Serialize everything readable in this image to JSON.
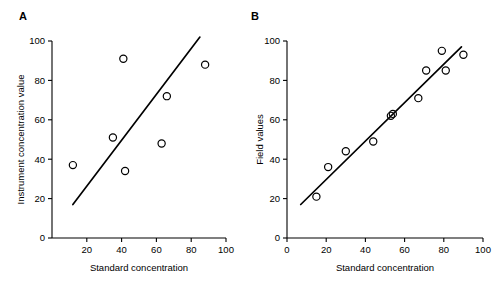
{
  "figure": {
    "background": "#ffffff",
    "ink": "#000000"
  },
  "chart_data": [
    {
      "type": "scatter",
      "panel_label": "A",
      "title": "",
      "xlabel": "Standard concentration",
      "ylabel": "Instrument concentration value",
      "xlim": [
        0,
        100
      ],
      "ylim": [
        0,
        100
      ],
      "xticks": [
        20,
        40,
        60,
        80,
        100
      ],
      "xtick_labels": [
        "20",
        "40",
        "60",
        "80",
        "100"
      ],
      "yticks": [
        0,
        20,
        40,
        60,
        80,
        100
      ],
      "ytick_labels": [
        "0",
        "20",
        "40",
        "60",
        "80",
        "100"
      ],
      "grid": false,
      "legend": "none",
      "marker": "open-circle",
      "points": [
        {
          "x": 12,
          "y": 37
        },
        {
          "x": 35,
          "y": 51
        },
        {
          "x": 41,
          "y": 91
        },
        {
          "x": 42,
          "y": 34
        },
        {
          "x": 63,
          "y": 48
        },
        {
          "x": 66,
          "y": 72
        },
        {
          "x": 88,
          "y": 88
        }
      ],
      "fit_line": {
        "type": "linear-regression",
        "x0": 12,
        "y0": 17,
        "x1": 85,
        "y1": 102
      }
    },
    {
      "type": "scatter",
      "panel_label": "B",
      "title": "",
      "xlabel": "Standard concentration",
      "ylabel": "Field values",
      "xlim": [
        0,
        100
      ],
      "ylim": [
        0,
        100
      ],
      "xticks": [
        0,
        20,
        40,
        60,
        80,
        100
      ],
      "xtick_labels": [
        "0",
        "20",
        "40",
        "60",
        "80",
        "100"
      ],
      "yticks": [
        0,
        20,
        40,
        60,
        80,
        100
      ],
      "ytick_labels": [
        "0",
        "20",
        "40",
        "60",
        "80",
        "100"
      ],
      "grid": false,
      "legend": "none",
      "marker": "open-circle",
      "points": [
        {
          "x": 15,
          "y": 21
        },
        {
          "x": 21,
          "y": 36
        },
        {
          "x": 30,
          "y": 44
        },
        {
          "x": 44,
          "y": 49
        },
        {
          "x": 53,
          "y": 62
        },
        {
          "x": 54,
          "y": 63
        },
        {
          "x": 67,
          "y": 71
        },
        {
          "x": 71,
          "y": 85
        },
        {
          "x": 79,
          "y": 95
        },
        {
          "x": 81,
          "y": 85
        },
        {
          "x": 90,
          "y": 93
        }
      ],
      "fit_line": {
        "type": "linear-regression",
        "x0": 7,
        "y0": 17,
        "x1": 89,
        "y1": 97
      }
    }
  ]
}
